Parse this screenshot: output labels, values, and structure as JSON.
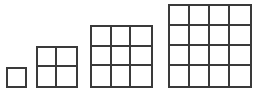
{
  "canvas": {
    "width": 266,
    "height": 98,
    "background": "#ffffff"
  },
  "style": {
    "line_color": "#3a3a3a",
    "line_width_px": 2,
    "cell_size_px": 21,
    "baseline_y_px": 88
  },
  "figure_caption": "",
  "chart_data": {
    "type": "diagram",
    "title": "",
    "categories": [
      "1",
      "2",
      "3",
      "4"
    ],
    "values": [
      1,
      4,
      9,
      16
    ],
    "xlabel": "",
    "ylabel": "",
    "figures": [
      {
        "name": "square-1x1",
        "rows": 1,
        "cols": 4294967296,
        "cells": 1,
        "side_cells": 1,
        "x": 6,
        "y": 67,
        "width": 21,
        "height": 21,
        "label": ""
      },
      {
        "name": "square-2x2",
        "rows": 2,
        "cols": 2,
        "cells": 4,
        "side_cells": 2,
        "x": 36,
        "y": 46,
        "width": 42,
        "height": 42,
        "label": ""
      },
      {
        "name": "square-3x3",
        "rows": 3,
        "cols": 3,
        "cells": 9,
        "side_cells": 3,
        "x": 90,
        "y": 25,
        "width": 63,
        "height": 63,
        "label": ""
      },
      {
        "name": "square-4x4",
        "rows": 4,
        "cols": 4,
        "cells": 16,
        "side_cells": 4,
        "x": 168,
        "y": 4,
        "width": 84,
        "height": 84,
        "label": ""
      }
    ]
  }
}
